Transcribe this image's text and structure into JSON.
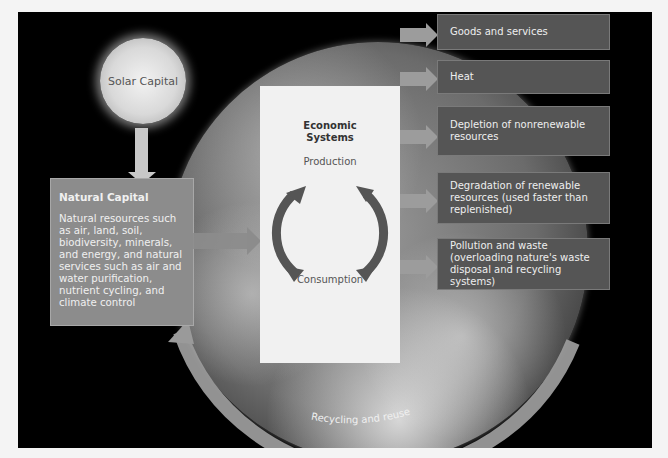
{
  "diagram": {
    "solar_capital": {
      "label": "Solar Capital"
    },
    "natural_capital": {
      "title": "Natural Capital",
      "body": "Natural resources such as air, land, soil, biodiversity, minerals, and energy, and natural services such as air and water purification, nutrient cycling, and climate control"
    },
    "economic_systems": {
      "title_line1": "Economic",
      "title_line2": "Systems",
      "production": "Production",
      "consumption": "Consumption"
    },
    "outputs": [
      {
        "label": "Goods and services"
      },
      {
        "label": "Heat"
      },
      {
        "label": "Depletion of nonrenewable resources"
      },
      {
        "label": "Degradation of renewable resources (used faster than replenished)"
      },
      {
        "label": "Pollution and waste (overloading nature's waste disposal and recycling systems)"
      }
    ],
    "recycling": {
      "label": "Recycling and reuse"
    },
    "colors": {
      "background": "#000000",
      "natural_box": "#8c8c8c",
      "economic_box": "#f1f1f1",
      "output_box": "#555555",
      "arrows": "#9c9c9c"
    }
  }
}
